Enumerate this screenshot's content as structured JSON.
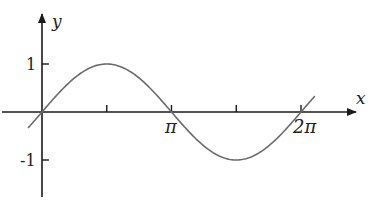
{
  "chart_data": {
    "type": "line",
    "title": "",
    "function": "y = sin(x)",
    "xlabel": "x",
    "ylabel": "y",
    "x_ticks": [
      {
        "value": 1.5708,
        "label": ""
      },
      {
        "value": 3.14159,
        "label": "π"
      },
      {
        "value": 4.71239,
        "label": ""
      },
      {
        "value": 6.28319,
        "label": "2π"
      }
    ],
    "y_ticks": [
      {
        "value": 1,
        "label": "1"
      },
      {
        "value": -1,
        "label": "-1"
      }
    ],
    "xlim": [
      -0.34,
      6.62
    ],
    "ylim": [
      -1.2,
      1.2
    ],
    "grid": false,
    "legend": null,
    "series": [
      {
        "name": "sin(x)",
        "x": [
          -0.34,
          0,
          0.7854,
          1.5708,
          2.3562,
          3.14159,
          3.927,
          4.71239,
          5.4978,
          6.28319,
          6.62
        ],
        "values": [
          -0.333,
          0,
          0.707,
          1,
          0.707,
          0,
          -0.707,
          -1,
          -0.707,
          0,
          0.33
        ]
      }
    ],
    "colors": {
      "axis": "#1a1a1a",
      "curve": "#6b6b6b"
    }
  },
  "labels": {
    "x_axis": "x",
    "y_axis": "y",
    "tick_pi": "π",
    "tick_2pi": "2π",
    "tick_one": "1",
    "tick_neg_one": "-1"
  }
}
